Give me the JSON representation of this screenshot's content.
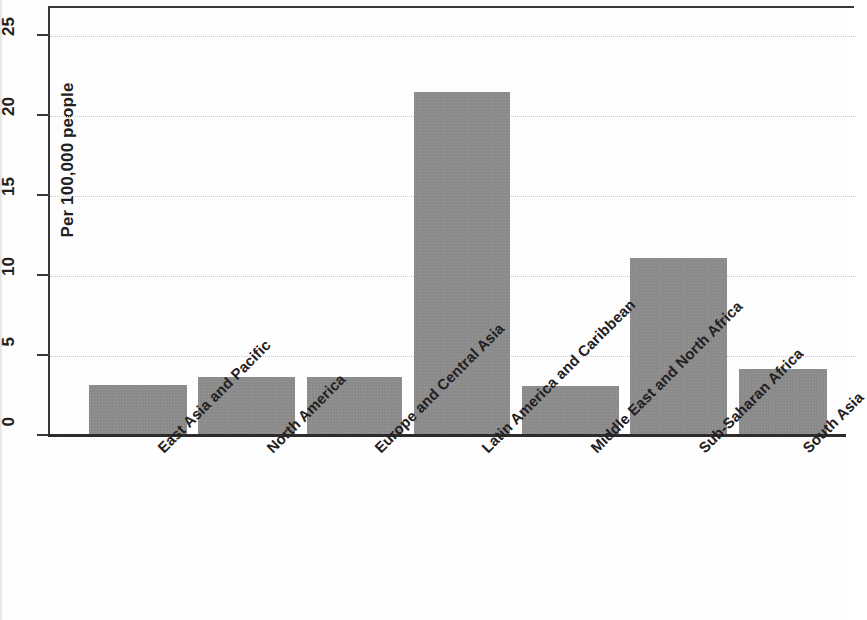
{
  "chart_data": {
    "type": "bar",
    "title": "",
    "subtitle": "",
    "xlabel": "",
    "ylabel": "Per 100,000 people",
    "categories": [
      "East Asia and Pacific",
      "North America",
      "Europe and Central Asia",
      "Latin America and Caribbean",
      "Middle East and North Africa",
      "Sub-Saharan Africa",
      "South Asia"
    ],
    "values": [
      3.2,
      3.7,
      3.7,
      21.5,
      3.1,
      11.1,
      4.2
    ],
    "ylim": [
      0,
      26.8
    ],
    "yticks": [
      0,
      5,
      10,
      15,
      20,
      25
    ],
    "ytick_labels": [
      "0",
      "5",
      "10",
      "15",
      "20",
      "25"
    ],
    "grid": "horizontal-dotted",
    "legend": "none",
    "bar_color": "#8b8b8b",
    "axis_color": "#3a3738",
    "gridline_color": "#c9c9c9",
    "text_color": "#222021",
    "background_color": "#ffffff",
    "xtick_label_rotation": "-45"
  }
}
